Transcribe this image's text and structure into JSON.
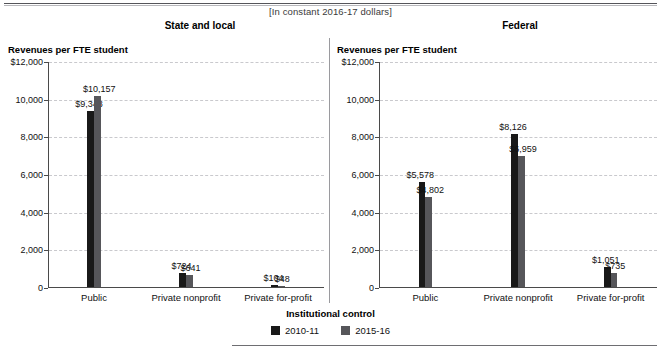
{
  "figure": {
    "clipped_header": "",
    "bracket_note": "[In constant 2016-17 dollars]",
    "legend_title": "Institutional control"
  },
  "chart_data": [
    {
      "type": "bar",
      "title": "State and local",
      "ylabel": "Revenues per FTE student",
      "xlabel": "Institutional control",
      "subtitle": "[In constant 2016-17 dollars]",
      "categories": [
        "Public",
        "Private nonprofit",
        "Private for-profit"
      ],
      "series": [
        {
          "name": "2010-11",
          "color": "#191919",
          "values": [
            9348,
            724,
            104
          ],
          "labels": [
            "$9,348",
            "$724",
            "$104"
          ]
        },
        {
          "name": "2015-16",
          "color": "#56565a",
          "values": [
            10157,
            641,
            48
          ],
          "labels": [
            "$10,157",
            "$641",
            "$48"
          ]
        }
      ],
      "ylim": [
        0,
        12000
      ],
      "yticks": [
        0,
        2000,
        4000,
        6000,
        8000,
        10000,
        12000
      ],
      "ytick_labels": [
        "0",
        "2,000",
        "4,000",
        "6,000",
        "8,000",
        "10,000",
        "$12,000"
      ],
      "grid": true,
      "legend_position": "bottom"
    },
    {
      "type": "bar",
      "title": "Federal",
      "ylabel": "Revenues per FTE student",
      "xlabel": "Institutional control",
      "subtitle": "[In constant 2016-17 dollars]",
      "categories": [
        "Public",
        "Private nonprofit",
        "Private for-profit"
      ],
      "series": [
        {
          "name": "2010-11",
          "color": "#191919",
          "values": [
            5578,
            8126,
            1051
          ],
          "labels": [
            "$5,578",
            "$8,126",
            "$1,051"
          ]
        },
        {
          "name": "2015-16",
          "color": "#56565a",
          "values": [
            4802,
            6959,
            735
          ],
          "labels": [
            "$4,802",
            "$6,959",
            "$735"
          ]
        }
      ],
      "ylim": [
        0,
        12000
      ],
      "yticks": [
        0,
        2000,
        4000,
        6000,
        8000,
        10000,
        12000
      ],
      "ytick_labels": [
        "0",
        "2,000",
        "4,000",
        "6,000",
        "8,000",
        "10,000",
        "$12,000"
      ],
      "grid": true,
      "legend_position": "bottom"
    }
  ]
}
